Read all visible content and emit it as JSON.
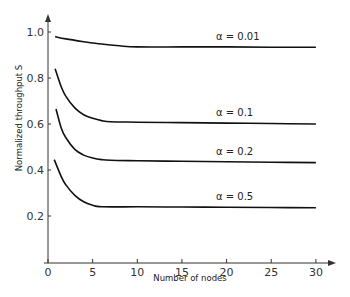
{
  "chart_data": {
    "type": "line",
    "title": "",
    "xlabel": "Number of nodes",
    "ylabel": "Normalized throughput  S",
    "xlim": [
      0,
      30
    ],
    "ylim": [
      0,
      1.0
    ],
    "xticks": [
      0,
      5,
      10,
      15,
      20,
      25,
      30
    ],
    "xtick_labels": [
      "0",
      "5",
      "10",
      "15",
      "20",
      "25",
      "30"
    ],
    "yticks": [
      0.2,
      0.4,
      0.6,
      0.8,
      1.0
    ],
    "ytick_labels": [
      "0.2",
      "0.4",
      "0.6",
      "0.8",
      "1.0"
    ],
    "grid": false,
    "legend": "inline labels above each curve at right",
    "series": [
      {
        "name": "α = 0.01",
        "label": "α = 0.01",
        "x": [
          0.8,
          2,
          4,
          6,
          8,
          10,
          15,
          20,
          25,
          30
        ],
        "y": [
          0.98,
          0.97,
          0.958,
          0.948,
          0.94,
          0.935,
          0.935,
          0.935,
          0.934,
          0.934
        ]
      },
      {
        "name": "α = 0.1",
        "label": "α = 0.1",
        "x": [
          0.8,
          1.5,
          2,
          3,
          4,
          5,
          6,
          7,
          10,
          15,
          20,
          25,
          30
        ],
        "y": [
          0.84,
          0.76,
          0.72,
          0.67,
          0.64,
          0.625,
          0.615,
          0.61,
          0.608,
          0.606,
          0.604,
          0.602,
          0.6
        ]
      },
      {
        "name": "α = 0.2",
        "label": "α = 0.2",
        "x": [
          0.9,
          1.5,
          2,
          3,
          4,
          5,
          6,
          7,
          10,
          15,
          20,
          25,
          30
        ],
        "y": [
          0.665,
          0.58,
          0.54,
          0.49,
          0.465,
          0.452,
          0.445,
          0.442,
          0.44,
          0.438,
          0.436,
          0.434,
          0.432
        ]
      },
      {
        "name": "α = 0.5",
        "label": "α = 0.5",
        "x": [
          0.7,
          1.5,
          2,
          3,
          4,
          5,
          6,
          10,
          15,
          20,
          25,
          30
        ],
        "y": [
          0.445,
          0.37,
          0.335,
          0.29,
          0.262,
          0.247,
          0.24,
          0.24,
          0.239,
          0.238,
          0.237,
          0.236
        ]
      }
    ]
  }
}
